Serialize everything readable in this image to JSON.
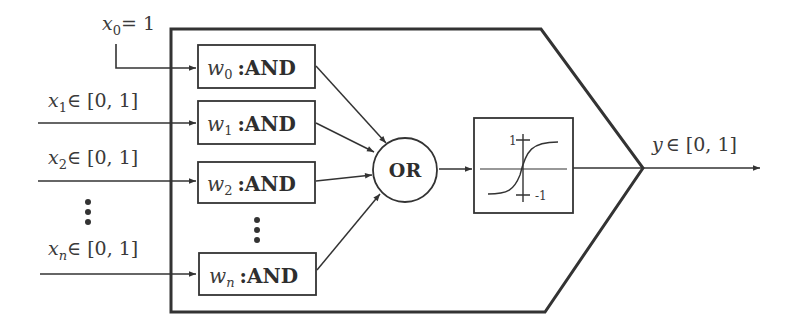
{
  "diagram": {
    "type": "fuzzy-neuron (AND-OR) block diagram",
    "bias_input": {
      "var": "x",
      "sub": "0",
      "value": "= 1"
    },
    "inputs": [
      {
        "var": "x",
        "sub": "1",
        "range": "∈ [0, 1]"
      },
      {
        "var": "x",
        "sub": "2",
        "range": "∈ [0, 1]"
      },
      {
        "var": "x",
        "sub": "n",
        "range": "∈ [0, 1]"
      }
    ],
    "and_nodes": [
      {
        "weight": "w",
        "sub": "0",
        "op": ":AND"
      },
      {
        "weight": "w",
        "sub": "1",
        "op": ":AND"
      },
      {
        "weight": "w",
        "sub": "2",
        "op": ":AND"
      },
      {
        "weight": "w",
        "sub": "n",
        "op": ":AND"
      }
    ],
    "or_node": {
      "label": "OR"
    },
    "activation": {
      "type": "sigmoid",
      "upper_tick": "1",
      "lower_tick": "-1"
    },
    "output": {
      "var": "y",
      "range": "∈ [0, 1]"
    },
    "ellipsis": "⋮"
  }
}
